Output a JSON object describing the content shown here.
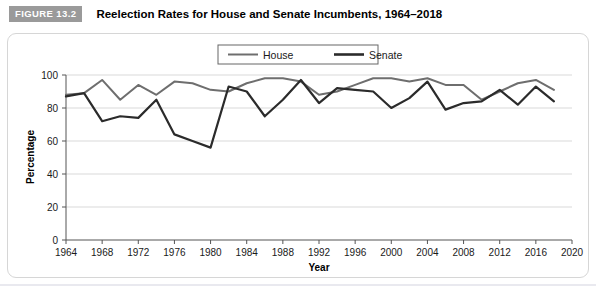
{
  "header": {
    "badge": "FIGURE 13.2",
    "title": "Reelection Rates for House and Senate Incumbents, 1964–2018"
  },
  "colors": {
    "house_line": "#6e6e6e",
    "senate_line": "#2b2b2b",
    "gridline": "#d9d9d9",
    "axis": "#555555",
    "badge_bg": "#9a9a9a",
    "card_border": "#d6d6d6",
    "text": "#1a1a1a"
  },
  "legend": {
    "position": "top-center",
    "entries": [
      {
        "label": "House",
        "color": "#6e6e6e"
      },
      {
        "label": "Senate",
        "color": "#2b2b2b"
      }
    ]
  },
  "chart_data": {
    "type": "line",
    "title": "Reelection Rates for House and Senate Incumbents, 1964–2018",
    "xlabel": "Year",
    "ylabel": "Percentage",
    "xlim": [
      1964,
      2020
    ],
    "ylim": [
      0,
      100
    ],
    "xticks": [
      1964,
      1968,
      1972,
      1976,
      1980,
      1984,
      1988,
      1992,
      1996,
      2000,
      2004,
      2008,
      2012,
      2016,
      2020
    ],
    "yticks": [
      0,
      20,
      40,
      60,
      80,
      100
    ],
    "grid": "horizontal",
    "x": [
      1964,
      1966,
      1968,
      1970,
      1972,
      1974,
      1976,
      1978,
      1980,
      1982,
      1984,
      1986,
      1988,
      1990,
      1992,
      1994,
      1996,
      1998,
      2000,
      2002,
      2004,
      2006,
      2008,
      2010,
      2012,
      2014,
      2016,
      2018
    ],
    "series": [
      {
        "name": "House",
        "color": "#6e6e6e",
        "values": [
          88,
          89,
          97,
          85,
          94,
          88,
          96,
          95,
          91,
          90,
          95,
          98,
          98,
          96,
          88,
          90,
          94,
          98,
          98,
          96,
          98,
          94,
          94,
          85,
          90,
          95,
          97,
          91
        ]
      },
      {
        "name": "Senate",
        "color": "#2b2b2b",
        "values": [
          87,
          89,
          72,
          75,
          74,
          85,
          64,
          60,
          56,
          93,
          90,
          75,
          85,
          97,
          83,
          92,
          91,
          90,
          80,
          86,
          96,
          79,
          83,
          84,
          91,
          82,
          93,
          84
        ]
      }
    ]
  }
}
